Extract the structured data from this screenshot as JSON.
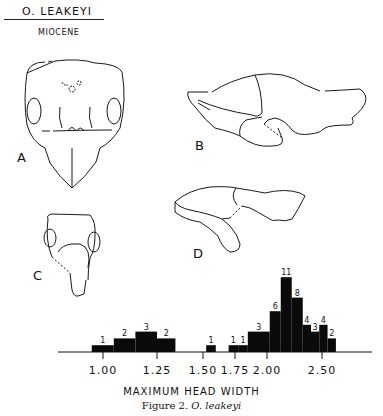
{
  "header": {
    "title": "O. LEAKEYI",
    "era": "MIOCENE"
  },
  "figure_labels": {
    "a": "A",
    "b": "B",
    "c": "C",
    "d": "D"
  },
  "caption": {
    "prefix": "Figure 2.",
    "species": "O. leakeyi"
  },
  "chart_data": {
    "type": "bar",
    "title": "",
    "xlabel": "MAXIMUM HEAD WIDTH",
    "ylabel": "",
    "xticks": [
      1.0,
      1.25,
      1.5,
      1.75,
      2.0,
      2.5
    ],
    "xtick_labels": [
      "1.00",
      "1.25",
      "1.50",
      "1.75",
      "2.00",
      "2.50"
    ],
    "xlim": [
      0.8,
      2.95
    ],
    "grid": false,
    "bins": [
      {
        "x0": 0.95,
        "x1": 1.05,
        "count": 1
      },
      {
        "x0": 1.05,
        "x1": 1.15,
        "count": 2
      },
      {
        "x0": 1.15,
        "x1": 1.25,
        "count": 3
      },
      {
        "x0": 1.25,
        "x1": 1.35,
        "count": 2
      },
      {
        "x0": 1.525,
        "x1": 1.6,
        "count": 1
      },
      {
        "x0": 1.7,
        "x1": 1.775,
        "count": 1
      },
      {
        "x0": 1.775,
        "x1": 1.85,
        "count": 1
      },
      {
        "x0": 1.85,
        "x1": 2.025,
        "count": 3
      },
      {
        "x0": 2.025,
        "x1": 2.125,
        "count": 6
      },
      {
        "x0": 2.125,
        "x1": 2.225,
        "count": 11
      },
      {
        "x0": 2.225,
        "x1": 2.325,
        "count": 8
      },
      {
        "x0": 2.325,
        "x1": 2.4,
        "count": 4
      },
      {
        "x0": 2.4,
        "x1": 2.475,
        "count": 3
      },
      {
        "x0": 2.475,
        "x1": 2.55,
        "count": 4
      },
      {
        "x0": 2.55,
        "x1": 2.625,
        "count": 2
      }
    ],
    "ylim": [
      0,
      12
    ]
  }
}
